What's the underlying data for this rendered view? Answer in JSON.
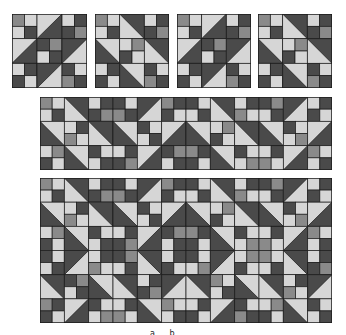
{
  "colors": {
    "dark": "#4a4a4a",
    "light": "#d6d6d6",
    "mid": "#8a8a8a",
    "line": "#1c1c1c"
  },
  "caption": "a b",
  "quilts": [
    {
      "name": "block-1",
      "x": 12,
      "y": 14,
      "w": 75,
      "h": 74,
      "cols": 3,
      "rows": 3,
      "cells": [
        "fp0",
        "hst-br",
        "fp1",
        "hst-br",
        "fp0",
        "hst-tl",
        "fp1",
        "hst-tl",
        "fp0"
      ]
    },
    {
      "name": "block-2",
      "x": 95,
      "y": 14,
      "w": 74,
      "h": 74,
      "cols": 3,
      "rows": 3,
      "cells": [
        "fp0",
        "hst-tr",
        "fp1",
        "hst-bl",
        "fp1",
        "hst-tr",
        "fp1",
        "hst-bl",
        "fp0"
      ]
    },
    {
      "name": "block-3",
      "x": 177,
      "y": 14,
      "w": 74,
      "h": 74,
      "cols": 3,
      "rows": 3,
      "cells": [
        "fp0",
        "hst-br",
        "fp1",
        "hst-br",
        "fp0",
        "hst-tl",
        "fp1",
        "hst-tl",
        "fp0"
      ]
    },
    {
      "name": "block-4",
      "x": 258,
      "y": 14,
      "w": 74,
      "h": 74,
      "cols": 3,
      "rows": 3,
      "cells": [
        "fp0",
        "hst-tr",
        "fp1",
        "hst-bl",
        "fp1",
        "hst-tr",
        "fp1",
        "hst-bl",
        "fp0"
      ]
    },
    {
      "name": "row-quilt",
      "x": 40,
      "y": 97,
      "w": 292,
      "h": 73,
      "cols": 12,
      "rows": 3,
      "cells": [
        "fp0",
        "hst-tr",
        "fp1",
        "fp0",
        "hst-tl",
        "fp1",
        "fp0",
        "hst-tr",
        "fp1",
        "fp0",
        "hst-tl",
        "fp1",
        "hst-bl",
        "fp1",
        "hst-tr",
        "hst-bl",
        "fp0",
        "hst-br",
        "hst-bl",
        "fp1",
        "hst-tr",
        "hst-bl",
        "fp0",
        "hst-br",
        "fp1",
        "hst-bl",
        "fp0",
        "fp1",
        "hst-br",
        "fp0",
        "fp1",
        "hst-bl",
        "fp0",
        "fp1",
        "hst-br",
        "fp0"
      ]
    },
    {
      "name": "full-quilt",
      "x": 40,
      "y": 178,
      "w": 292,
      "h": 145,
      "cols": 12,
      "rows": 6,
      "cells": [
        "fp0",
        "hst-tr",
        "fp1",
        "fp0",
        "hst-tl",
        "fp1",
        "fp0",
        "hst-tr",
        "fp1",
        "fp0",
        "hst-tl",
        "fp1",
        "hst-bl",
        "fp1",
        "hst-tr",
        "hst-bl",
        "fp0",
        "hst-br",
        "hst-bl",
        "fp1",
        "hst-tr",
        "hst-bl",
        "fp0",
        "hst-br",
        "fp1",
        "hst-bl",
        "fp0",
        "fp1",
        "hst-br",
        "fp0",
        "fp1",
        "hst-bl",
        "fp0",
        "fp1",
        "hst-br",
        "fp0",
        "fp0",
        "hst-tl",
        "fp1",
        "fp0",
        "hst-tr",
        "fp1",
        "fp0",
        "hst-tl",
        "fp1",
        "fp0",
        "hst-tr",
        "fp1",
        "hst-tr",
        "fp0",
        "hst-bl",
        "hst-tr",
        "fp1",
        "hst-tl",
        "hst-tr",
        "fp0",
        "hst-bl",
        "hst-tr",
        "fp1",
        "hst-tl",
        "fp1",
        "hst-br",
        "fp0",
        "fp1",
        "hst-bl",
        "fp0",
        "fp1",
        "hst-br",
        "fp0",
        "fp1",
        "hst-bl",
        "fp0"
      ]
    }
  ]
}
